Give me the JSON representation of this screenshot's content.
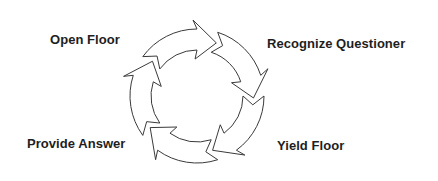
{
  "diagram": {
    "type": "cycle",
    "direction": "clockwise",
    "stroke_color": "#3a3a3a",
    "fill_color": "#ffffff",
    "text_color": "#1e1e1e",
    "ring": {
      "cx": 197,
      "cy": 96,
      "outer_r": 67,
      "inner_r": 46
    },
    "arrows": [
      {
        "id": "arrow-1",
        "tip_angle": -70
      },
      {
        "id": "arrow-2",
        "tip_angle": 2
      },
      {
        "id": "arrow-3",
        "tip_angle": 74
      },
      {
        "id": "arrow-4",
        "tip_angle": 146
      },
      {
        "id": "arrow-5",
        "tip_angle": 218
      }
    ],
    "labels": [
      {
        "id": "open-floor",
        "text": "Open Floor",
        "x": 50,
        "y": 33
      },
      {
        "id": "recognize-questioner",
        "text": "Recognize Questioner",
        "x": 267,
        "y": 37
      },
      {
        "id": "provide-answer",
        "text": "Provide Answer",
        "x": 27,
        "y": 137
      },
      {
        "id": "yield-floor",
        "text": "Yield Floor",
        "x": 277,
        "y": 139
      }
    ]
  }
}
